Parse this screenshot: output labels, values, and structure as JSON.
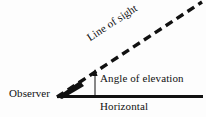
{
  "diagram": {
    "background_color": "#fdfdfd",
    "ink_color": "#111111",
    "labels": {
      "observer": "Observer",
      "line_of_sight": "Line of sight",
      "angle_of_elevation": "Angle of elevation",
      "horizontal": "Horizontal"
    },
    "geometry": {
      "vertex": [
        57,
        97
      ],
      "horizontal_end": [
        203,
        97
      ],
      "line_of_sight_end": [
        202,
        2
      ],
      "angle_arrow_x": 95,
      "angle_arrow_top_y": 70,
      "angle_arrow_base_y": 96,
      "line_of_sight_angle_degrees": 33.2,
      "horizontal_stroke_width": 3,
      "line_of_sight_stroke_width": 3.4,
      "dash_pattern": "8 5"
    }
  }
}
